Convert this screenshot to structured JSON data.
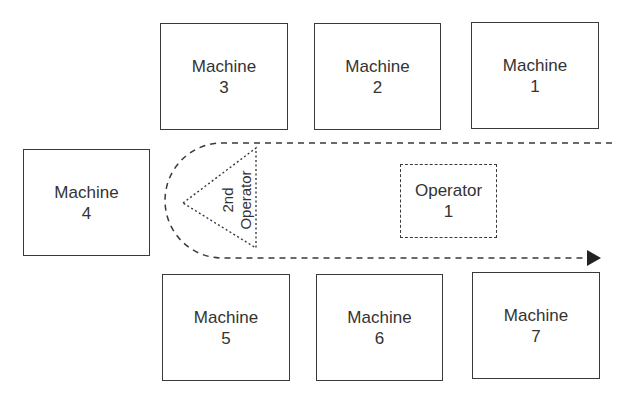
{
  "machines": [
    {
      "id": "machine-3",
      "label": "Machine",
      "number": "3",
      "x": 160,
      "y": 23,
      "w": 128,
      "h": 107
    },
    {
      "id": "machine-2",
      "label": "Machine",
      "number": "2",
      "x": 314,
      "y": 23,
      "w": 127,
      "h": 107
    },
    {
      "id": "machine-1",
      "label": "Machine",
      "number": "1",
      "x": 471,
      "y": 22,
      "w": 128,
      "h": 107
    },
    {
      "id": "machine-4",
      "label": "Machine",
      "number": "4",
      "x": 23,
      "y": 149,
      "w": 127,
      "h": 107
    },
    {
      "id": "machine-5",
      "label": "Machine",
      "number": "5",
      "x": 162,
      "y": 274,
      "w": 128,
      "h": 107
    },
    {
      "id": "machine-6",
      "label": "Machine",
      "number": "6",
      "x": 316,
      "y": 274,
      "w": 127,
      "h": 107
    },
    {
      "id": "machine-7",
      "label": "Machine",
      "number": "7",
      "x": 472,
      "y": 272,
      "w": 128,
      "h": 107
    }
  ],
  "operator1": {
    "label": "Operator",
    "number": "1",
    "x": 400,
    "y": 164,
    "w": 97,
    "h": 74
  },
  "operator2": {
    "line1": "2nd",
    "line2": "Operator"
  },
  "colors": {
    "stroke": "#3a3a3a",
    "text": "#333333",
    "background": "#ffffff"
  }
}
